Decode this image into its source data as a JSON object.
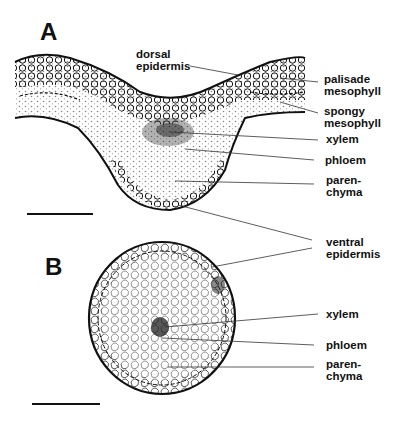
{
  "figure": {
    "panels": [
      {
        "letter": "A",
        "description": "cross-section of leaf blade with midrib",
        "labels": {
          "dorsal_epidermis": [
            "dorsal",
            "epidermis"
          ],
          "palisade_mesophyll": [
            "palisade",
            "mesophyll"
          ],
          "spongy_mesophyll": [
            "spongy",
            "mesophyll"
          ],
          "xylem": [
            "xylem"
          ],
          "phloem": [
            "phloem"
          ],
          "parenchyma": [
            "paren-",
            "chyma"
          ]
        }
      },
      {
        "letter": "B",
        "description": "circular cross-section",
        "labels": {
          "xylem": [
            "xylem"
          ],
          "phloem": [
            "phloem"
          ],
          "parenchyma": [
            "paren-",
            "chyma"
          ]
        }
      }
    ],
    "shared_labels": {
      "ventral_epidermis": [
        "ventral",
        "epidermis"
      ]
    },
    "colors": {
      "ink": "#111111",
      "background": "#ffffff"
    }
  }
}
